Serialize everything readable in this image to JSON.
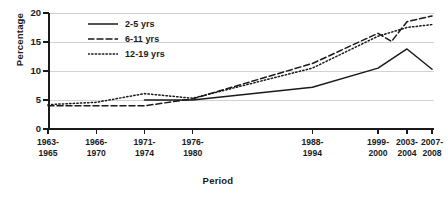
{
  "chart_data": {
    "type": "line",
    "title": "",
    "xlabel": "Period",
    "ylabel": "Percentage",
    "ylim": [
      0,
      20
    ],
    "yticks": [
      0,
      5,
      10,
      15,
      20
    ],
    "grid": true,
    "legend_position": "top-left",
    "categories": [
      "1963-\n1965",
      "1966-\n1970",
      "1971-\n1974",
      "1976-\n1980",
      "1988-\n1994",
      "1999-\n2000",
      "2003-\n2004",
      "2007-\n2008"
    ],
    "category_lines": [
      [
        "1963-",
        "1965"
      ],
      [
        "1966-",
        "1970"
      ],
      [
        "1971-",
        "1974"
      ],
      [
        "1976-",
        "1980"
      ],
      [
        "1988-",
        "1994"
      ],
      [
        "1999-",
        "2000"
      ],
      [
        "2003-",
        "2004"
      ],
      [
        "2007-",
        "2008"
      ]
    ],
    "x_positions_pct": [
      0,
      12.5,
      25,
      37.5,
      68.5,
      85.5,
      93,
      99.5
    ],
    "series": [
      {
        "name": "2-5 yrs",
        "style": "solid",
        "values": [
          null,
          null,
          5.0,
          5.0,
          7.2,
          10.5,
          13.8,
          10.3
        ]
      },
      {
        "name": "6-11 yrs",
        "style": "dashed",
        "values": [
          4.0,
          4.0,
          4.0,
          5.2,
          11.3,
          16.5,
          18.5,
          19.5
        ]
      },
      {
        "name": "12-19 yrs",
        "style": "dotted",
        "values": [
          4.2,
          4.6,
          6.1,
          5.3,
          10.5,
          16.0,
          17.5,
          18.0
        ]
      }
    ],
    "extra_vertices": {
      "6-11 yrs": [
        [
          89.0,
          15.1
        ]
      ],
      "12-19 yrs": []
    },
    "colors": {
      "line": "#1a1a1a",
      "grid": "#d2d2d2",
      "axis": "#1a1a1a",
      "background": "#ffffff"
    }
  },
  "legend": {
    "items": [
      {
        "label": "2-5 yrs",
        "style": "solid"
      },
      {
        "label": "6-11 yrs",
        "style": "dashed"
      },
      {
        "label": "12-19 yrs",
        "style": "dotted"
      }
    ]
  }
}
